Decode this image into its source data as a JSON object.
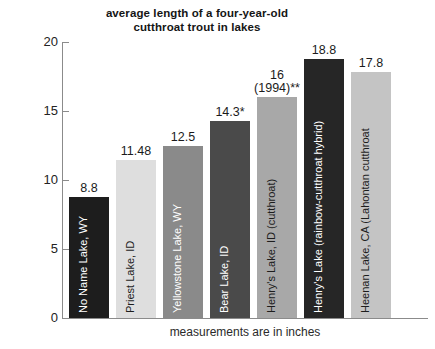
{
  "chart_data": {
    "type": "bar",
    "title": "average length of a four-year-old cutthroat trout in lakes",
    "title_lines": [
      "average length of a four-year-old",
      "cutthroat trout in lakes"
    ],
    "xlabel": "measurements are in inches",
    "ylabel": "",
    "ylim": [
      0,
      20
    ],
    "ytick_labels": [
      "0",
      "5",
      "10",
      "15",
      "20"
    ],
    "ytick_values": [
      0,
      5,
      10,
      15,
      20
    ],
    "grid": false,
    "legend": "none",
    "categories": [
      "No Name Lake, WY",
      "Priest Lake, ID",
      "Yellowstone Lake, WY",
      "Bear Lake, ID",
      "Henry's Lake, ID (cutthroat)",
      "Henry's Lake (rainbow-cutthroat hybrid)",
      "Heenan Lake, CA (Lahontan cutthroat"
    ],
    "values": [
      8.8,
      11.48,
      12.5,
      14.3,
      16,
      18.8,
      17.8
    ],
    "value_labels": [
      "8.8",
      "11.48",
      "12.5",
      "14.3*",
      "16",
      "18.8",
      "17.8"
    ],
    "value_label_lines": [
      [
        "8.8"
      ],
      [
        "11.48"
      ],
      [
        "12.5"
      ],
      [
        "14.3*"
      ],
      [
        "16",
        "(1994)**"
      ],
      [
        "18.8"
      ],
      [
        "17.8"
      ]
    ],
    "bar_colors": [
      "#1d1d1d",
      "#dedede",
      "#8a8a8a",
      "#4a4a4a",
      "#a8a8a8",
      "#262626",
      "#c4c4c4"
    ],
    "bar_label_colors": [
      "#ffffff",
      "#1d1d1d",
      "#ffffff",
      "#ffffff",
      "#1d1d1d",
      "#ffffff",
      "#1d1d1d"
    ]
  },
  "bars": [
    {
      "category": "No Name Lake, WY",
      "value": 8.8,
      "value_label": "8.8",
      "value_label_2": "",
      "color": "#1d1d1d",
      "text_color": "#ffffff"
    },
    {
      "category": "Priest Lake, ID",
      "value": 11.48,
      "value_label": "11.48",
      "value_label_2": "",
      "color": "#dedede",
      "text_color": "#1d1d1d"
    },
    {
      "category": "Yellowstone Lake, WY",
      "value": 12.5,
      "value_label": "12.5",
      "value_label_2": "",
      "color": "#8a8a8a",
      "text_color": "#ffffff"
    },
    {
      "category": "Bear Lake, ID",
      "value": 14.3,
      "value_label": "14.3*",
      "value_label_2": "",
      "color": "#4a4a4a",
      "text_color": "#ffffff"
    },
    {
      "category": "Henry's Lake, ID (cutthroat)",
      "value": 16,
      "value_label": "16",
      "value_label_2": "(1994)**",
      "color": "#a8a8a8",
      "text_color": "#1d1d1d"
    },
    {
      "category": "Henry's Lake (rainbow-cutthroat hybrid)",
      "value": 18.8,
      "value_label": "18.8",
      "value_label_2": "",
      "color": "#262626",
      "text_color": "#ffffff"
    },
    {
      "category": "Heenan Lake, CA (Lahontan cutthroat",
      "value": 17.8,
      "value_label": "17.8",
      "value_label_2": "",
      "color": "#c4c4c4",
      "text_color": "#1d1d1d"
    }
  ],
  "axis": {
    "ticks": [
      {
        "label": "20",
        "value": 20
      },
      {
        "label": "15",
        "value": 15
      },
      {
        "label": "10",
        "value": 10
      },
      {
        "label": "5",
        "value": 5
      },
      {
        "label": "0",
        "value": 0
      }
    ]
  },
  "footer": {
    "note": "measurements are in inches"
  }
}
